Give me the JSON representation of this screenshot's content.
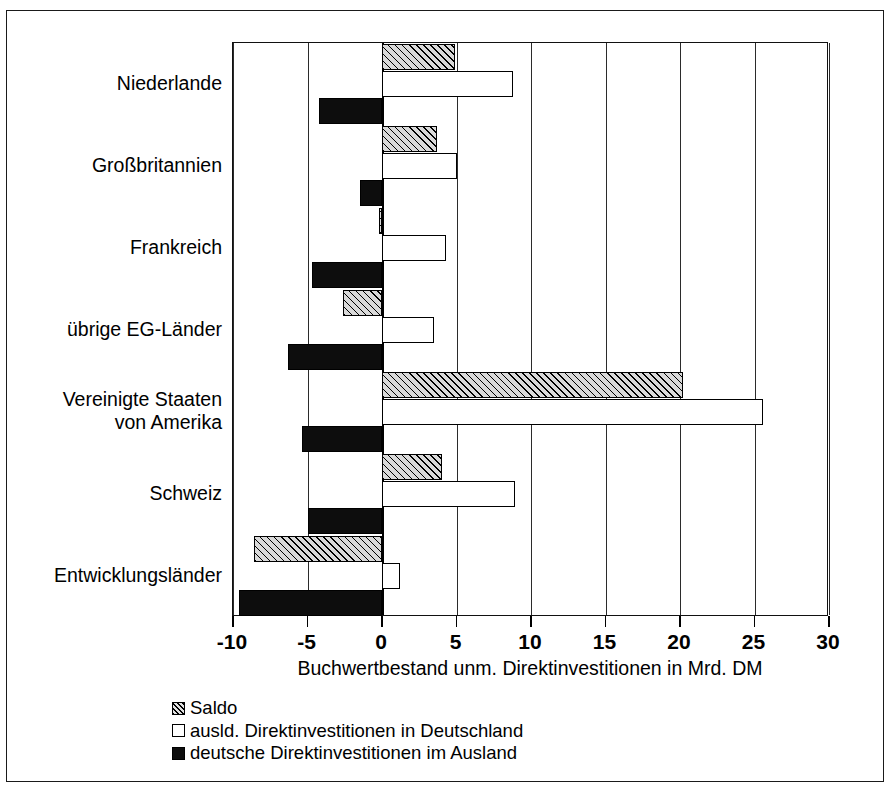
{
  "chart_data": {
    "type": "bar",
    "orientation": "horizontal",
    "title": "",
    "xlabel": "Buchwertbestand unm. Direktinvestitionen in Mrd. DM",
    "ylabel": "",
    "xlim": [
      -10,
      30
    ],
    "xticks": [
      -10,
      -5,
      0,
      5,
      10,
      15,
      20,
      25,
      30
    ],
    "xtick_labels": [
      "-10",
      "-5",
      "0",
      "5",
      "10",
      "15",
      "20",
      "25",
      "30"
    ],
    "grid": true,
    "legend_position": "below-left",
    "categories": [
      "Niederlande",
      "Großbritannien",
      "Frankreich",
      "übrige EG-Länder",
      "Vereinigte Staaten\nvon Amerika",
      "Schweiz",
      "Entwicklungsländer"
    ],
    "series": [
      {
        "name": "Saldo",
        "fill": "hatched",
        "values": [
          4.9,
          3.7,
          -0.2,
          -2.6,
          20.2,
          4.0,
          -8.6
        ]
      },
      {
        "name": "ausld. Direktinvestitionen in Deutschland",
        "fill": "white",
        "values": [
          8.8,
          5.0,
          4.3,
          3.5,
          25.6,
          8.9,
          1.2
        ]
      },
      {
        "name": "deutsche Direktinvestitionen im Ausland",
        "fill": "black",
        "values": [
          -4.2,
          -1.5,
          -4.7,
          -6.3,
          -5.4,
          -5.0,
          -9.6
        ]
      }
    ]
  },
  "legend": {
    "items": [
      {
        "label": "Saldo",
        "swatch": "hatched"
      },
      {
        "label": "ausld. Direktinvestitionen in Deutschland",
        "swatch": "white"
      },
      {
        "label": "deutsche Direktinvestitionen im Ausland",
        "swatch": "black"
      }
    ]
  },
  "colors": {
    "axis": "#000000",
    "grid": "#2b2b2b",
    "bar_saldo": "#d9d9d9",
    "bar_inward": "#ffffff",
    "bar_outward": "#0d0d0d",
    "background": "#ffffff"
  },
  "scan_artifact": ""
}
